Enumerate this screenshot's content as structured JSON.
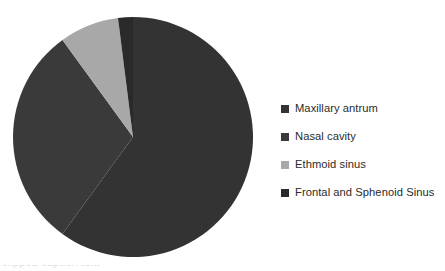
{
  "figure": {
    "background_color": "#ffffff",
    "width": 445,
    "height": 271
  },
  "legend": {
    "position": "right",
    "items": [
      {
        "label": "Maxillary antrum",
        "color": "#333333",
        "swatch_icon": "legend-square-icon"
      },
      {
        "label": "Nasal cavity",
        "color": "#3a3a3a",
        "swatch_icon": "legend-square-icon"
      },
      {
        "label": "Ethmoid sinus",
        "color": "#a8a8a8",
        "swatch_icon": "legend-square-icon"
      },
      {
        "label": "Frontal and Sphenoid Sinus",
        "color": "#2a2a2a",
        "swatch_icon": "legend-square-icon"
      }
    ]
  },
  "bottom_text": {
    "clipped_caption": "clipped caption text"
  },
  "chart_data": {
    "type": "pie",
    "title": "",
    "subtitle": "",
    "xlabel": "",
    "ylabel": "",
    "grid": false,
    "legend_position": "right",
    "start_angle_deg": 0,
    "direction": "clockwise",
    "center": {
      "x": 133,
      "y": 137
    },
    "radius": 120,
    "clipped_at_bottom": true,
    "labels": [
      "Maxillary antrum",
      "Nasal cavity",
      "Ethmoid sinus",
      "Frontal and Sphenoid Sinus"
    ],
    "values": [
      60,
      30,
      8,
      2
    ],
    "percentages": [
      60,
      30,
      8,
      2
    ],
    "colors": [
      "#333333",
      "#3a3a3a",
      "#a8a8a8",
      "#2a2a2a"
    ],
    "slices": [
      {
        "label": "Maxillary antrum",
        "value": 60,
        "percent": 60,
        "start_angle_deg": 0,
        "end_angle_deg": 216,
        "color": "#333333"
      },
      {
        "label": "Nasal cavity",
        "value": 30,
        "percent": 30,
        "start_angle_deg": 216,
        "end_angle_deg": 324,
        "color": "#3a3a3a"
      },
      {
        "label": "Ethmoid sinus",
        "value": 8,
        "percent": 8,
        "start_angle_deg": 324,
        "end_angle_deg": 352.8,
        "color": "#a8a8a8"
      },
      {
        "label": "Frontal and Sphenoid Sinus",
        "value": 2,
        "percent": 2,
        "start_angle_deg": 352.8,
        "end_angle_deg": 360,
        "color": "#2a2a2a"
      }
    ]
  }
}
